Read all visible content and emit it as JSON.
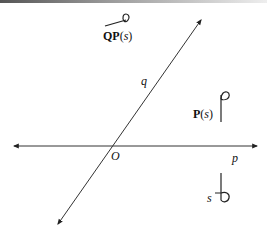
{
  "diagram": {
    "axes": {
      "horizontal": {
        "label": "p",
        "arrows": "both"
      },
      "diagonal": {
        "label": "q",
        "arrows": "both"
      },
      "origin_label": "O"
    },
    "glyphs": [
      {
        "id": "s",
        "label": "s",
        "description": "vertical stroke with loop at bottom-right"
      },
      {
        "id": "P_s",
        "label_main": "P",
        "label_arg": "s",
        "description": "vertical stroke with loop at top-right (reflection of s across p)"
      },
      {
        "id": "QP_s",
        "label_main": "QP",
        "label_arg": "s",
        "description": "slanted stroke with loop at top-right (reflection of P(s) across q)"
      }
    ],
    "colors": {
      "stroke": "#222222",
      "text": "#111111",
      "background": "#ffffff"
    }
  }
}
